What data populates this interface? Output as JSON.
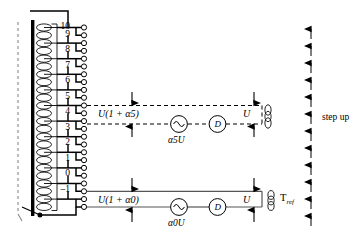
{
  "diagram": {
    "type": "electrical-schematic",
    "background": "#ffffff",
    "line_color": "#000000",
    "core_color": "#000000"
  },
  "divider": {
    "taps": [
      {
        "label": "10",
        "index": 10
      },
      {
        "label": "9",
        "index": 9
      },
      {
        "label": "8",
        "index": 8
      },
      {
        "label": "7",
        "index": 7
      },
      {
        "label": "6",
        "index": 6
      },
      {
        "label": "5",
        "index": 5
      },
      {
        "label": "4",
        "index": 4
      },
      {
        "label": "3",
        "index": 3
      },
      {
        "label": "2",
        "index": 2
      },
      {
        "label": "1",
        "index": 1
      },
      {
        "label": "0",
        "index": 0
      },
      {
        "label": "–1",
        "index": -1
      }
    ],
    "winding_turns": 24,
    "terminal_count": 12
  },
  "circuits": [
    {
      "id": "upper",
      "style": "dashed",
      "tap": "5",
      "voltage_label": "U(1 + α5)",
      "source_label": "α5U",
      "detector_label": "D",
      "output_label": "U",
      "coil_label": "⟨⟨"
    },
    {
      "id": "lower",
      "style": "solid",
      "tap": "0",
      "voltage_label": "U(1 + α0)",
      "source_label": "α0U",
      "detector_label": "D",
      "output_label": "U",
      "reference_label": "T",
      "reference_sub": "ref"
    }
  ],
  "step_indicator": {
    "label": "step up",
    "arrow_count": 11,
    "direction": "up"
  }
}
